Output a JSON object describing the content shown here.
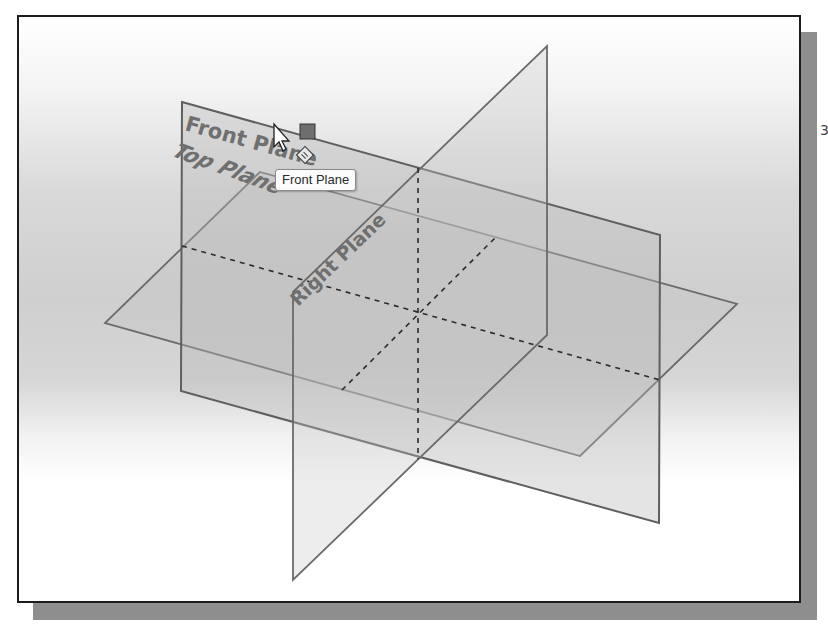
{
  "viewport": {
    "view": "isometric",
    "background_gradient": [
      "#ffffff",
      "#cfcfcf",
      "#ffffff"
    ],
    "border_color": "#1c1c1c",
    "shadow_color": "#8e8e8e"
  },
  "planes": [
    {
      "name": "Front Plane",
      "label": "Front Plane",
      "state": "highlighted",
      "edge_color": "#6a6a6a",
      "fill_color": "#bdbdbd"
    },
    {
      "name": "Top Plane",
      "label": "Top Plane",
      "state": "normal",
      "edge_color": "#6a6a6a",
      "fill_color": "#c4c4c4"
    },
    {
      "name": "Right Plane",
      "label": "Right Plane",
      "state": "normal",
      "edge_color": "#6a6a6a",
      "fill_color": "#c8c8c8"
    }
  ],
  "tooltip": {
    "text": "Front Plane"
  },
  "cursor": {
    "type": "select-plane-cursor",
    "glyphs": [
      "arrow-pointer",
      "filled-square",
      "plane-diamond"
    ]
  },
  "edge_glyph": {
    "text": "3"
  }
}
